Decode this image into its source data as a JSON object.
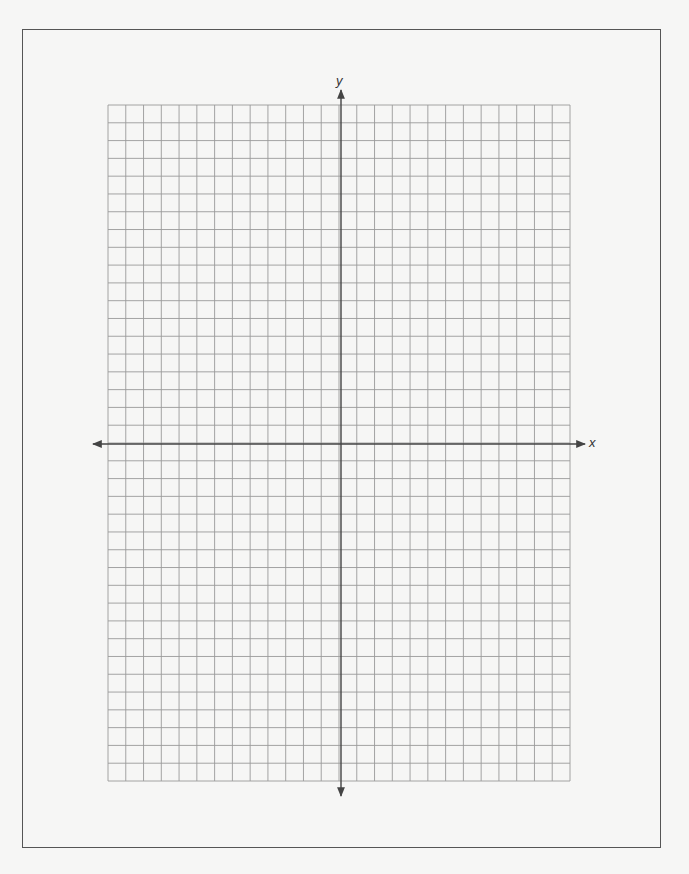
{
  "page": {
    "background": "#f6f6f5",
    "frame_color": "#555555"
  },
  "coordinate_plane": {
    "type": "blank-graph-paper",
    "grid": {
      "columns": 26,
      "rows": 38,
      "columns_left_of_y_axis": 13,
      "columns_right_of_y_axis": 13,
      "rows_above_x_axis": 19,
      "rows_below_x_axis": 19,
      "line_color": "#9a9a9a"
    },
    "axes": {
      "color": "#444444",
      "x_label": "x",
      "y_label": "y",
      "arrows": "both-ends"
    }
  }
}
